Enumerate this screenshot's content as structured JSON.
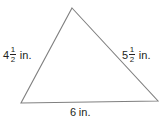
{
  "figure": {
    "type": "triangle-diagram",
    "background_color": "#ffffff",
    "stroke_color": "#808080",
    "text_color": "#231f20",
    "units": "in.",
    "shape": {
      "name": "triangle",
      "vertices": [
        {
          "name": "apex",
          "x": 72,
          "y": 8
        },
        {
          "name": "bottom-right",
          "x": 158,
          "y": 101
        },
        {
          "name": "bottom-left",
          "x": 21,
          "y": 103
        }
      ]
    },
    "labels": {
      "left_side": {
        "whole": "4",
        "numerator": "1",
        "denominator": "2",
        "unit": "in.",
        "full_text": "4 1/2 in."
      },
      "right_side": {
        "whole": "5",
        "numerator": "1",
        "denominator": "2",
        "unit": "in.",
        "full_text": "5 1/2 in."
      },
      "bottom_side": {
        "whole": "6",
        "numerator": "",
        "denominator": "",
        "unit": "in.",
        "full_text": "6 in."
      }
    }
  }
}
